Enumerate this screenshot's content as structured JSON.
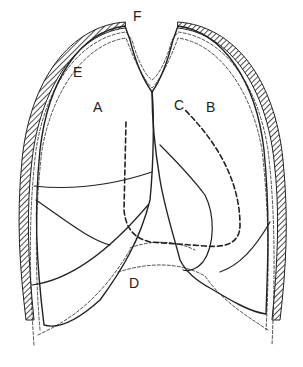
{
  "diagram": {
    "labels": [
      {
        "id": "A",
        "text": "A",
        "x": 118,
        "y": 101
      },
      {
        "id": "B",
        "text": "B",
        "x": 206,
        "y": 101
      },
      {
        "id": "C",
        "text": "C",
        "x": 174,
        "y": 98
      },
      {
        "id": "D",
        "text": "D",
        "x": 129,
        "y": 281
      },
      {
        "id": "E",
        "text": "E",
        "x": 72,
        "y": 64
      },
      {
        "id": "F",
        "text": "F",
        "x": 133,
        "y": 10
      }
    ],
    "colors": {
      "ink": "#222222",
      "background": "#ffffff"
    }
  }
}
